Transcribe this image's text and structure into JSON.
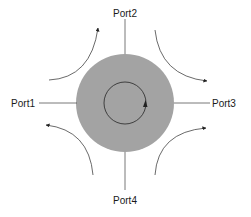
{
  "diagram": {
    "type": "circulator",
    "ports": [
      {
        "id": "port1",
        "label": "Port1",
        "side": "left"
      },
      {
        "id": "port2",
        "label": "Port2",
        "side": "top"
      },
      {
        "id": "port3",
        "label": "Port3",
        "side": "right"
      },
      {
        "id": "port4",
        "label": "Port4",
        "side": "bottom"
      }
    ],
    "rotation": "clockwise",
    "flows": [
      {
        "from": "port1",
        "to": "port2",
        "quadrant": "top-left"
      },
      {
        "from": "port2",
        "to": "port3",
        "quadrant": "top-right"
      },
      {
        "from": "port3",
        "to": "port4",
        "quadrant": "bottom-right"
      },
      {
        "from": "port4",
        "to": "port1",
        "quadrant": "bottom-left"
      }
    ],
    "colors": {
      "disc": "#a3a3a3",
      "line": "#333333",
      "text": "#1a1a1a",
      "background": "#ffffff"
    }
  }
}
